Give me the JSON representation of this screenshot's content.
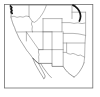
{
  "figure": {
    "width_px": 100,
    "height_px": 97,
    "background_color": "#ffffff",
    "frame": {
      "name": "map-frame",
      "stroke_color": "#6e6e6e",
      "x": 4,
      "y": 4,
      "width": 89,
      "height": 84
    },
    "caption": ""
  },
  "map": {
    "region_label": "Western United States",
    "line_color_states": "#7a7a7a",
    "line_color_coast": "#6a6a6a",
    "line_color_border": "#5a5a5a",
    "highlight_color": "#141414",
    "features": [
      {
        "name": "pacific-coastline",
        "label": "Pacific Coast"
      },
      {
        "name": "state-boundaries",
        "label": "State boundaries"
      },
      {
        "name": "mexico-border",
        "label": "US–Mexico border"
      },
      {
        "name": "baja-peninsula",
        "label": "Baja California peninsula"
      },
      {
        "name": "puget-sound-highlight",
        "label": "Puget Sound inlet"
      },
      {
        "name": "northeast-river-highlight",
        "label": "Missouri River reach"
      }
    ],
    "states_shown": [
      "Washington",
      "Oregon",
      "California",
      "Idaho",
      "Nevada",
      "Utah",
      "Arizona",
      "Montana",
      "Wyoming",
      "Colorado",
      "New Mexico",
      "North Dakota",
      "South Dakota",
      "Nebraska",
      "Kansas",
      "Oklahoma",
      "Texas"
    ]
  }
}
